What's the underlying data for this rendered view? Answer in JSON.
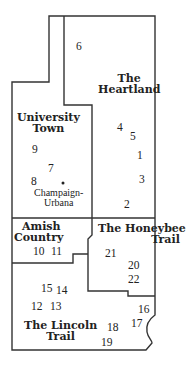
{
  "map": {
    "regions": [
      {
        "id": "heartland",
        "name_line1": "The",
        "name_line2": "Heartland"
      },
      {
        "id": "university-town",
        "name_line1": "University",
        "name_line2": "Town"
      },
      {
        "id": "amish-country",
        "name_line1": "Amish",
        "name_line2": "Country"
      },
      {
        "id": "honeybee-trail",
        "name_line1": "The Honeybee",
        "name_line2": "Trail"
      },
      {
        "id": "lincoln-trail",
        "name_line1": "The Lincoln",
        "name_line2": "Trail"
      }
    ],
    "city": {
      "name_line1": "Champaign-",
      "name_line2": "Urbana"
    },
    "markers": [
      "1",
      "2",
      "3",
      "4",
      "5",
      "6",
      "7",
      "8",
      "9",
      "10",
      "11",
      "12",
      "13",
      "14",
      "15",
      "16",
      "17",
      "18",
      "19",
      "20",
      "21",
      "22"
    ],
    "colors": {
      "line": "#333333",
      "background": "#ffffff",
      "text": "#222222"
    }
  }
}
